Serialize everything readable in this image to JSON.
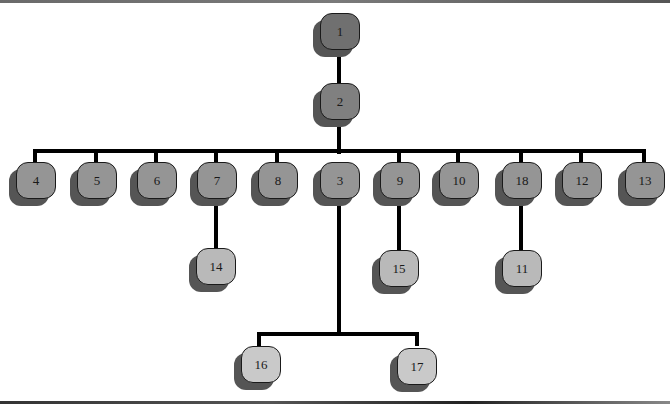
{
  "diagram": {
    "type": "tree",
    "colors": {
      "level0": "#707070",
      "level1": "#808080",
      "level2": "#959595",
      "level3": "#b9b9b9",
      "level4": "#c9c9c9",
      "shadow": "#555555",
      "connector": "#000000"
    },
    "nodes": [
      {
        "id": "1",
        "label": "1",
        "parent": null
      },
      {
        "id": "2",
        "label": "2",
        "parent": "1"
      },
      {
        "id": "4",
        "label": "4",
        "parent": "2"
      },
      {
        "id": "5",
        "label": "5",
        "parent": "2"
      },
      {
        "id": "6",
        "label": "6",
        "parent": "2"
      },
      {
        "id": "7",
        "label": "7",
        "parent": "2"
      },
      {
        "id": "8",
        "label": "8",
        "parent": "2"
      },
      {
        "id": "3",
        "label": "3",
        "parent": "2"
      },
      {
        "id": "9",
        "label": "9",
        "parent": "2"
      },
      {
        "id": "10",
        "label": "10",
        "parent": "2"
      },
      {
        "id": "18",
        "label": "18",
        "parent": "2"
      },
      {
        "id": "12",
        "label": "12",
        "parent": "2"
      },
      {
        "id": "13",
        "label": "13",
        "parent": "2"
      },
      {
        "id": "14",
        "label": "14",
        "parent": "7"
      },
      {
        "id": "15",
        "label": "15",
        "parent": "9"
      },
      {
        "id": "11",
        "label": "11",
        "parent": "18"
      },
      {
        "id": "16",
        "label": "16",
        "parent": "3"
      },
      {
        "id": "17",
        "label": "17",
        "parent": "3"
      }
    ]
  }
}
